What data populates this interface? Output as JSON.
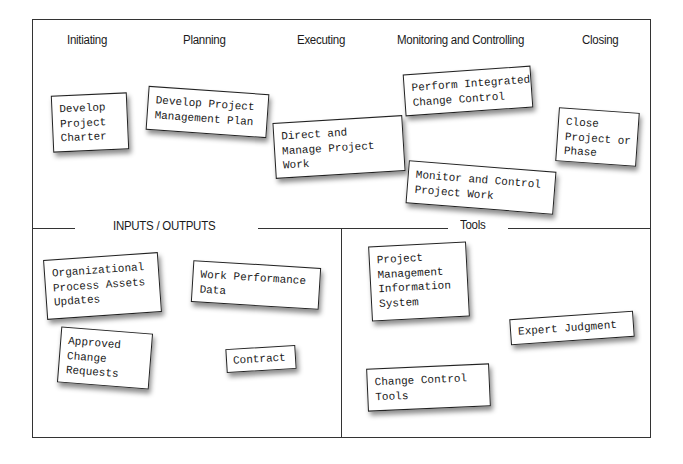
{
  "diagram": {
    "phases": [
      {
        "label": "Initiating"
      },
      {
        "label": "Planning"
      },
      {
        "label": "Executing"
      },
      {
        "label": "Monitoring and Controlling"
      },
      {
        "label": "Closing"
      }
    ],
    "processes": [
      {
        "label": "Develop\nProject\nCharter",
        "phase": "Initiating"
      },
      {
        "label": "Develop Project\nManagement Plan",
        "phase": "Planning"
      },
      {
        "label": "Direct and\nManage Project\nWork",
        "phase": "Executing"
      },
      {
        "label": "Perform Integrated\nChange Control",
        "phase": "Monitoring and Controlling"
      },
      {
        "label": "Monitor and Control\nProject Work",
        "phase": "Monitoring and Controlling"
      },
      {
        "label": "Close\nProject or\nPhase",
        "phase": "Closing"
      }
    ],
    "inputs_outputs": {
      "title": "INPUTS / OUTPUTS",
      "items": [
        {
          "label": "Organizational\nProcess Assets\nUpdates"
        },
        {
          "label": "Work Performance\nData"
        },
        {
          "label": "Approved\nChange\nRequests"
        },
        {
          "label": "Contract"
        }
      ]
    },
    "tools": {
      "title": "Tools",
      "items": [
        {
          "label": "Project\nManagement\nInformation\nSystem"
        },
        {
          "label": "Expert Judgment"
        },
        {
          "label": "Change Control\nTools"
        }
      ]
    }
  }
}
